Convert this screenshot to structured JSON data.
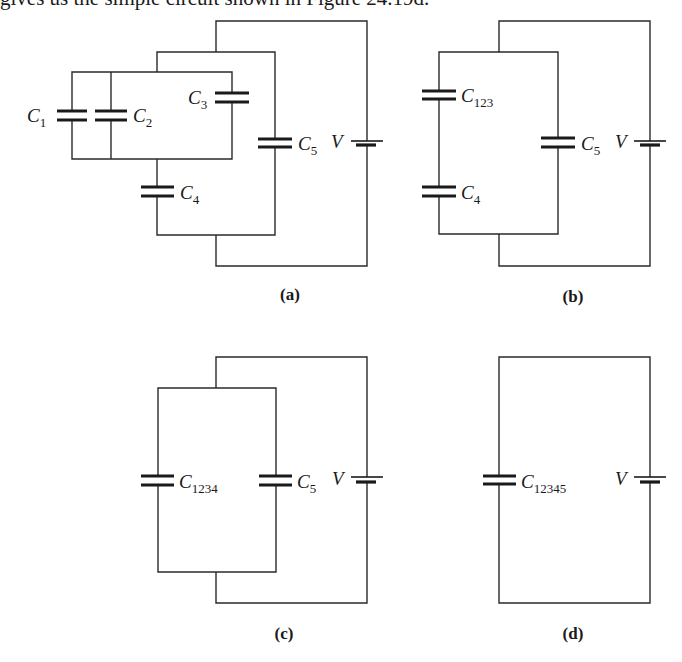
{
  "caption": {
    "text": "gives us the simple circuit shown in Figure 24.19d."
  },
  "panels": [
    {
      "id": "a",
      "label": "(a)",
      "components": [
        {
          "name": "C",
          "sub": "1"
        },
        {
          "name": "C",
          "sub": "2"
        },
        {
          "name": "C",
          "sub": "3"
        },
        {
          "name": "C",
          "sub": "4"
        },
        {
          "name": "C",
          "sub": "5"
        },
        {
          "name": "V",
          "sub": ""
        }
      ]
    },
    {
      "id": "b",
      "label": "(b)",
      "components": [
        {
          "name": "C",
          "sub": "123"
        },
        {
          "name": "C",
          "sub": "4"
        },
        {
          "name": "C",
          "sub": "5"
        },
        {
          "name": "V",
          "sub": ""
        }
      ]
    },
    {
      "id": "c",
      "label": "(c)",
      "components": [
        {
          "name": "C",
          "sub": "1234"
        },
        {
          "name": "C",
          "sub": "5"
        },
        {
          "name": "V",
          "sub": ""
        }
      ]
    },
    {
      "id": "d",
      "label": "(d)",
      "components": [
        {
          "name": "C",
          "sub": "12345"
        },
        {
          "name": "V",
          "sub": ""
        }
      ]
    }
  ],
  "colors": {
    "ink": "#1a1a1a",
    "background": "#ffffff"
  }
}
